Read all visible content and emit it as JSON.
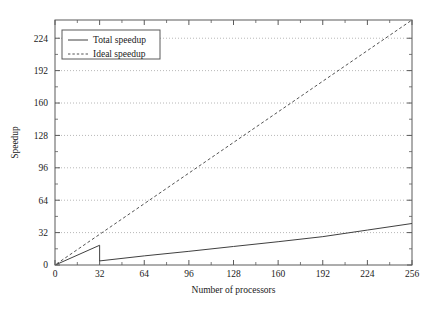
{
  "chart_data": {
    "type": "line",
    "title": "",
    "subtitle": "",
    "xlabel": "Number of processors",
    "ylabel": "Speedup",
    "xlim": [
      0,
      256
    ],
    "ylim": [
      0,
      242
    ],
    "xticks": [
      0,
      32,
      64,
      96,
      128,
      160,
      192,
      224,
      256
    ],
    "xtick_labels": [
      "0",
      "32",
      "64",
      "96",
      "128",
      "160",
      "192",
      "224",
      "256"
    ],
    "yticks": [
      0,
      32,
      64,
      96,
      128,
      160,
      192,
      224
    ],
    "ytick_labels": [
      "0",
      "32",
      "64",
      "96",
      "128",
      "160",
      "192",
      "224"
    ],
    "grid": "horizontal-dotted",
    "minor_ticks": true,
    "legend_position": "top-left-inside",
    "frame": true,
    "series": [
      {
        "name": "Total speedup",
        "style": "solid",
        "color": "#404040",
        "x": [
          1,
          32,
          32,
          33,
          64,
          96,
          128,
          160,
          192,
          224,
          256
        ],
        "values": [
          0.5,
          19.5,
          4.0,
          4.2,
          9.0,
          13.5,
          18.3,
          23.0,
          28.0,
          34.5,
          41.0
        ]
      },
      {
        "name": "Ideal speedup",
        "style": "dashed",
        "color": "#404040",
        "x": [
          1,
          256
        ],
        "values": [
          1,
          242
        ]
      }
    ],
    "annotations": [
      "Total speedup drops discontinuously at 32 processors from about 19.5 to about 4"
    ]
  },
  "legend": {
    "entries": [
      {
        "label": "Total speedup",
        "style": "solid"
      },
      {
        "label": "Ideal speedup",
        "style": "dashed"
      }
    ]
  },
  "colors": {
    "frame": "#5a5a5a",
    "grid": "#9a9a9a",
    "series": "#404040",
    "background": "#ffffff"
  }
}
